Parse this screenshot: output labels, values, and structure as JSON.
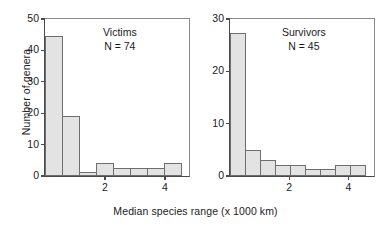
{
  "chart_data": {
    "type": "bar",
    "title": "",
    "xlabel": "Median species range (x 1000 km)",
    "ylabel": "Number of genera",
    "grid": false,
    "legend": "none",
    "layout": "two side-by-side histogram panels sharing one x axis title",
    "panels": [
      {
        "name": "victims",
        "annotation_title": "Victims",
        "annotation_n": "N = 74",
        "xlim": [
          0,
          4.8
        ],
        "ylim": [
          0,
          50
        ],
        "yticks": [
          0,
          10,
          20,
          30,
          40,
          50
        ],
        "ytick_labels": [
          "0",
          "10",
          "20",
          "30",
          "40",
          "50"
        ],
        "xticks": [
          2,
          4
        ],
        "xtick_labels": [
          "2",
          "4"
        ],
        "bin_width": 0.6,
        "bin_edges": [
          0,
          0.6,
          1.2,
          1.8,
          2.4,
          3.0,
          3.6,
          4.2,
          4.8
        ],
        "categories": [
          "0-0.6",
          "0.6-1.2",
          "1.2-1.8",
          "1.8-2.4",
          "2.4-3.0",
          "3.0-3.6",
          "3.6-4.2",
          "4.2-4.8"
        ],
        "values": [
          44.5,
          19,
          1.3,
          4,
          2.5,
          2.5,
          2.5,
          4
        ]
      },
      {
        "name": "survivors",
        "annotation_title": "Survivors",
        "annotation_n": "N = 45",
        "xlim": [
          0,
          4.86
        ],
        "ylim": [
          0,
          30
        ],
        "yticks": [
          0,
          10,
          20,
          30
        ],
        "ytick_labels": [
          "0",
          "10",
          "20",
          "30"
        ],
        "xticks": [
          2,
          4
        ],
        "xtick_labels": [
          "2",
          "4"
        ],
        "bin_width": 0.54,
        "bin_edges": [
          0,
          0.54,
          1.08,
          1.62,
          2.16,
          2.7,
          3.24,
          3.78,
          4.32,
          4.86
        ],
        "categories": [
          "0-0.54",
          "0.54-1.08",
          "1.08-1.62",
          "1.62-2.16",
          "2.16-2.7",
          "2.7-3.24",
          "3.24-3.78",
          "3.78-4.32",
          "4.32-4.86"
        ],
        "values": [
          27.3,
          5,
          3,
          2.2,
          2.2,
          1.3,
          1.3,
          2.2,
          2.2
        ]
      }
    ]
  },
  "colors": {
    "bar_fill": "#e3e3e3",
    "bar_edge": "#6e6e6e",
    "axis": "#4a4a4a",
    "frame_light": "#8a8a8a",
    "text": "#1a1a1a",
    "background": "#ffffff"
  }
}
